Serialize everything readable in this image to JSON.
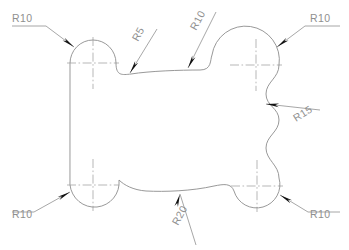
{
  "drawing": {
    "title": "Radius dimensioned bone-shaped profile",
    "background_color": "#ffffff",
    "profile_color": "#8d8d8d",
    "centerline_color": "#9a9a9a",
    "leader_color": "#8a8a8a",
    "arrow_color": "#121212",
    "text_color": "#8f8f8f",
    "canvas": {
      "width": 349,
      "height": 250
    }
  },
  "dimensions": [
    {
      "id": "r10-top-left",
      "label": "R10",
      "value": 10,
      "prefix": "R",
      "text_x": 12,
      "text_y": 22,
      "rotation": 0,
      "shelf": {
        "x1": 12,
        "y1": 26,
        "x2": 46,
        "y2": 26
      },
      "leader": {
        "x1": 46,
        "y1": 26,
        "x2": 74,
        "y2": 47
      },
      "arrow": {
        "x": 74,
        "y": 47,
        "angle": 37
      }
    },
    {
      "id": "r5-top-center-left",
      "label": "R5",
      "value": 5,
      "prefix": "R",
      "text_x": 138,
      "text_y": 42,
      "rotation": -62,
      "shelf": null,
      "leader": {
        "x1": 157,
        "y1": 29,
        "x2": 130,
        "y2": 73
      },
      "arrow": {
        "x": 130,
        "y": 73,
        "angle": 121
      }
    },
    {
      "id": "r10-top-center-right",
      "label": "R10",
      "value": 10,
      "prefix": "R",
      "text_x": 196,
      "text_y": 31,
      "rotation": -62,
      "shelf": null,
      "leader": {
        "x1": 216,
        "y1": 12,
        "x2": 188,
        "y2": 68
      },
      "arrow": {
        "x": 188,
        "y": 68,
        "angle": 117
      }
    },
    {
      "id": "r10-top-right",
      "label": "R10",
      "value": 10,
      "prefix": "R",
      "text_x": 310,
      "text_y": 22,
      "rotation": 0,
      "shelf": {
        "x1": 305,
        "y1": 26,
        "x2": 340,
        "y2": 26
      },
      "leader": {
        "x1": 305,
        "y1": 26,
        "x2": 277,
        "y2": 47
      },
      "arrow": {
        "x": 277,
        "y": 47,
        "angle": 143
      }
    },
    {
      "id": "r15-right",
      "label": "R15",
      "value": 15,
      "prefix": "R",
      "text_x": 296,
      "text_y": 122,
      "rotation": -32,
      "shelf": null,
      "leader": {
        "x1": 320,
        "y1": 110,
        "x2": 266,
        "y2": 104
      },
      "arrow": {
        "x": 266,
        "y": 104,
        "angle": 186
      }
    },
    {
      "id": "r10-bottom-left",
      "label": "R10",
      "value": 10,
      "prefix": "R",
      "text_x": 12,
      "text_y": 218,
      "rotation": 0,
      "shelf": {
        "x1": 12,
        "y1": 212,
        "x2": 34,
        "y2": 212
      },
      "leader": {
        "x1": 34,
        "y1": 212,
        "x2": 70,
        "y2": 192
      },
      "arrow": {
        "x": 70,
        "y": 192,
        "angle": -29
      }
    },
    {
      "id": "r20-bottom-center",
      "label": "R20",
      "value": 20,
      "prefix": "R",
      "text_x": 178,
      "text_y": 226,
      "rotation": -62,
      "shelf": null,
      "leader": {
        "x1": 196,
        "y1": 245,
        "x2": 180,
        "y2": 194
      },
      "arrow": {
        "x": 180,
        "y": 194,
        "angle": -73
      }
    },
    {
      "id": "r10-bottom-right",
      "label": "R10",
      "value": 10,
      "prefix": "R",
      "text_x": 310,
      "text_y": 218,
      "rotation": 0,
      "shelf": {
        "x1": 308,
        "y1": 212,
        "x2": 340,
        "y2": 212
      },
      "leader": {
        "x1": 308,
        "y1": 212,
        "x2": 280,
        "y2": 195
      },
      "arrow": {
        "x": 280,
        "y": 195,
        "angle": 211
      }
    }
  ],
  "centers": [
    {
      "id": "center-top-left",
      "x": 93,
      "y": 63,
      "h_half": 26,
      "v_half": 26
    },
    {
      "id": "center-top-right",
      "x": 256,
      "y": 65,
      "h_half": 26,
      "v_half": 26
    },
    {
      "id": "center-bottom-left",
      "x": 93,
      "y": 185,
      "h_half": 26,
      "v_half": 26
    },
    {
      "id": "center-bottom-right",
      "x": 257,
      "y": 186,
      "h_half": 26,
      "v_half": 26
    }
  ],
  "profile": {
    "description": "Closed bone/cross shaped outline built from four corner arcs, a straight left edge, a scalloped right edge, and waved top and bottom edges.",
    "path": "M 70,63 A 23,23 0 0 1 116,63 C 116,76 122,75 131,74 C 150,71 180,70 200,70 C 212,70 210,60 212,55 A 23,23 0 0 1 279,65 C 279,78 266,82 266,94 C 266,106 279,108 279,120 C 279,132 266,136 266,148 C 266,160 279,165 279,178 A 23,23 0 0 1 234,191 C 231,183 224,184 214,186 C 192,191 165,192 146,191 C 133,190 124,185 119,180 A 23,23 0 0 1 70,185 Z"
  }
}
